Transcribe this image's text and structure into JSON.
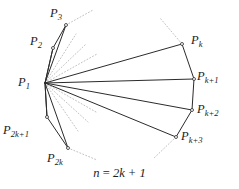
{
  "figure": {
    "caption": "n = 2k + 1",
    "caption_parts": {
      "variable_n": "n",
      "equals": "=",
      "expression": "2k + 1"
    },
    "colors": {
      "background": "#ffffff",
      "solid_stroke": "#2b2b2b",
      "dotted_stroke": "#b9b9b9",
      "text": "#1b1b1b"
    },
    "apex": {
      "name": "P1",
      "label_main": "P",
      "label_sub": "1",
      "x": 45,
      "y": 83
    },
    "vertices": [
      {
        "name": "P3",
        "label_main": "P",
        "label_sub": "3",
        "x": 66,
        "y": 25,
        "label_x": 50,
        "label_y": 7
      },
      {
        "name": "P2",
        "label_main": "P",
        "label_sub": "2",
        "x": 53,
        "y": 48,
        "label_x": 30,
        "label_y": 35
      },
      {
        "name": "P1",
        "label_main": "P",
        "label_sub": "1",
        "x": 45,
        "y": 83,
        "label_x": 18,
        "label_y": 76
      },
      {
        "name": "P2k+1",
        "label_main": "P",
        "label_sub": "2k+1",
        "x": 47,
        "y": 117,
        "label_x": 3,
        "label_y": 124
      },
      {
        "name": "P2k",
        "label_main": "P",
        "label_sub": "2k",
        "x": 68,
        "y": 148,
        "label_x": 47,
        "label_y": 152
      },
      {
        "name": "Pk",
        "label_main": "P",
        "label_sub": "k",
        "x": 182,
        "y": 44,
        "label_x": 191,
        "label_y": 34
      },
      {
        "name": "Pk+1",
        "label_main": "P",
        "label_sub": "k+1",
        "x": 194,
        "y": 79,
        "label_x": 197,
        "label_y": 70
      },
      {
        "name": "Pk+2",
        "label_main": "P",
        "label_sub": "k+2",
        "x": 192,
        "y": 110,
        "label_x": 197,
        "label_y": 103
      },
      {
        "name": "Pk+3",
        "label_main": "P",
        "label_sub": "k+3",
        "x": 176,
        "y": 137,
        "label_x": 181,
        "label_y": 130
      }
    ],
    "spokes_solid": [
      {
        "from": [
          45,
          83
        ],
        "to": [
          66,
          25
        ]
      },
      {
        "from": [
          45,
          83
        ],
        "to": [
          53,
          48
        ]
      },
      {
        "from": [
          45,
          83
        ],
        "to": [
          182,
          44
        ]
      },
      {
        "from": [
          45,
          83
        ],
        "to": [
          194,
          79
        ]
      },
      {
        "from": [
          45,
          83
        ],
        "to": [
          192,
          110
        ]
      },
      {
        "from": [
          45,
          83
        ],
        "to": [
          176,
          137
        ]
      },
      {
        "from": [
          45,
          83
        ],
        "to": [
          47,
          117
        ]
      },
      {
        "from": [
          45,
          83
        ],
        "to": [
          68,
          148
        ]
      }
    ],
    "spokes_dotted": [
      {
        "from": [
          45,
          83
        ],
        "to": [
          76,
          34
        ]
      },
      {
        "from": [
          45,
          83
        ],
        "to": [
          86,
          44
        ]
      },
      {
        "from": [
          45,
          83
        ],
        "to": [
          97,
          54
        ]
      },
      {
        "from": [
          45,
          83
        ],
        "to": [
          78,
          131
        ]
      },
      {
        "from": [
          45,
          83
        ],
        "to": [
          88,
          122
        ]
      },
      {
        "from": [
          45,
          83
        ],
        "to": [
          96,
          112
        ]
      }
    ],
    "boundary_solid": [
      {
        "from": [
          53,
          48
        ],
        "to": [
          66,
          25
        ]
      },
      {
        "from": [
          45,
          83
        ],
        "to": [
          53,
          48
        ]
      },
      {
        "from": [
          45,
          83
        ],
        "to": [
          47,
          117
        ]
      },
      {
        "from": [
          47,
          117
        ],
        "to": [
          68,
          148
        ]
      },
      {
        "from": [
          182,
          44
        ],
        "to": [
          194,
          79
        ]
      },
      {
        "from": [
          194,
          79
        ],
        "to": [
          192,
          110
        ]
      },
      {
        "from": [
          192,
          110
        ],
        "to": [
          176,
          137
        ]
      }
    ],
    "boundary_dotted": [
      {
        "from": [
          66,
          25
        ],
        "to": [
          93,
          10
        ]
      },
      {
        "from": [
          68,
          148
        ],
        "to": [
          97,
          160
        ]
      },
      {
        "from": [
          182,
          44
        ],
        "to": [
          160,
          18
        ]
      },
      {
        "from": [
          176,
          137
        ],
        "to": [
          153,
          159
        ]
      }
    ],
    "caption_position": {
      "y": 166
    }
  }
}
